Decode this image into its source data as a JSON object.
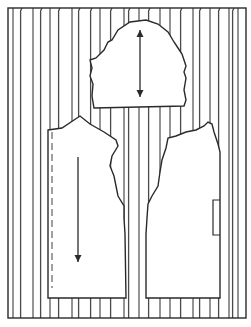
{
  "diagram": {
    "colors": {
      "background": "#ffffff",
      "ink": "#2a2a2a",
      "fabric_hatch": "#4a4a4a"
    },
    "frame": {
      "x": 8,
      "y": 8,
      "width": 238,
      "height": 310
    },
    "stripes": {
      "straight_lines_x": [
        13,
        33,
        50,
        72,
        100,
        124,
        139,
        160,
        170,
        193,
        210,
        229,
        238
      ],
      "pile_lines_x": [
        22,
        42,
        60,
        80,
        92,
        112,
        130,
        150,
        182,
        201,
        220,
        234
      ]
    },
    "pieces": [
      {
        "name": "sleeve",
        "grainline": "double-arrow",
        "arrow": {
          "x": 140,
          "y1": 30,
          "y2": 97
        }
      },
      {
        "name": "front",
        "grainline": "single-arrow-down",
        "arrow": {
          "x": 78,
          "y1": 157,
          "y2": 262
        },
        "fold_line": "dashed"
      },
      {
        "name": "back",
        "grainline": "none",
        "pocket_tab": true
      }
    ]
  }
}
